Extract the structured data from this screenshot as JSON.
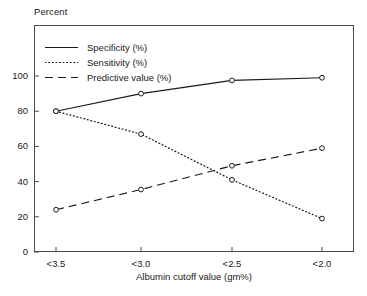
{
  "chart_data": {
    "type": "line",
    "title": "",
    "ylabel": "Percent",
    "xlabel": "Albumin cutoff value (gm%)",
    "categories": [
      "<3.5",
      "<3.0",
      "<2.5",
      "<2.0"
    ],
    "ylim": [
      0,
      110
    ],
    "yticks": [
      0,
      20,
      40,
      60,
      80,
      100
    ],
    "ytick_labels": [
      "0",
      "20",
      "40",
      "60",
      "80",
      "100"
    ],
    "grid": false,
    "legend_position": "top-left inside plot",
    "marker": "open-circle",
    "series": [
      {
        "name": "Specificity (%)",
        "style": "solid",
        "color": "#1a1a1a",
        "values": [
          80,
          90,
          97.5,
          99
        ]
      },
      {
        "name": "Sensitivity (%)",
        "style": "dotted",
        "color": "#1a1a1a",
        "values": [
          80,
          67,
          41,
          19
        ]
      },
      {
        "name": "Predictive value (%)",
        "style": "dashed",
        "color": "#1a1a1a",
        "values": [
          24,
          35.5,
          49,
          59
        ]
      }
    ]
  },
  "axes": {
    "y_title": "Percent",
    "x_title": "Albumin cutoff value (gm%)",
    "y_tick_labels": [
      "100",
      "80",
      "60",
      "40",
      "20",
      "0"
    ],
    "x_tick_labels": [
      "<3.5",
      "<3.0",
      "<2.5",
      "<2.0"
    ]
  },
  "legend": {
    "items": [
      {
        "label": "Specificity (%)",
        "style": "solid"
      },
      {
        "label": "Sensitivity (%)",
        "style": "dotted"
      },
      {
        "label": "Predictive value (%)",
        "style": "dashed"
      }
    ]
  },
  "caption": {
    "text": ""
  },
  "colors": {
    "ink": "#1a1a1a",
    "frame": "#4a4a4a",
    "background": "#ffffff"
  }
}
